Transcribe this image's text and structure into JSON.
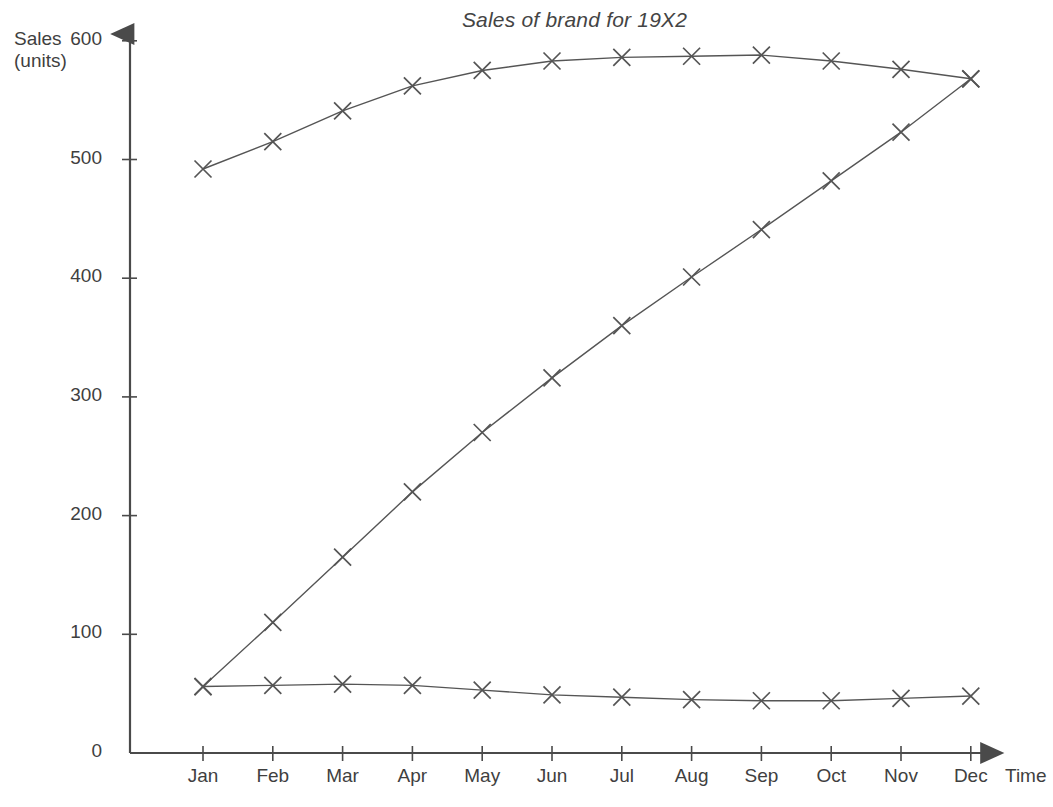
{
  "chart_data": {
    "type": "line",
    "title": "Sales of brand for 19X2",
    "xlabel": "Time",
    "ylabel": "Sales (units)",
    "ylabel_line1": "Sales",
    "ylabel_line2": "(units)",
    "categories": [
      "Jan",
      "Feb",
      "Mar",
      "Apr",
      "May",
      "Jun",
      "Jul",
      "Aug",
      "Sep",
      "Oct",
      "Nov",
      "Dec"
    ],
    "yticks": [
      0,
      100,
      200,
      300,
      400,
      500,
      600
    ],
    "ylim": [
      0,
      620
    ],
    "grid": false,
    "legend": "none",
    "marker": "x",
    "series": [
      {
        "name": "Saturating curve",
        "values": [
          492,
          515,
          541,
          562,
          575,
          583,
          586,
          587,
          588,
          583,
          576,
          568
        ]
      },
      {
        "name": "Rising S-curve",
        "values": [
          56,
          110,
          165,
          220,
          270,
          316,
          360,
          401,
          441,
          482,
          523,
          568
        ]
      },
      {
        "name": "Flat declining curve",
        "values": [
          56,
          57,
          58,
          57,
          53,
          49,
          47,
          45,
          44,
          44,
          46,
          48
        ]
      }
    ],
    "colors": {
      "line": "#555555",
      "axis": "#4a4a4a",
      "text": "#3f3f3f",
      "background": "#ffffff"
    }
  }
}
